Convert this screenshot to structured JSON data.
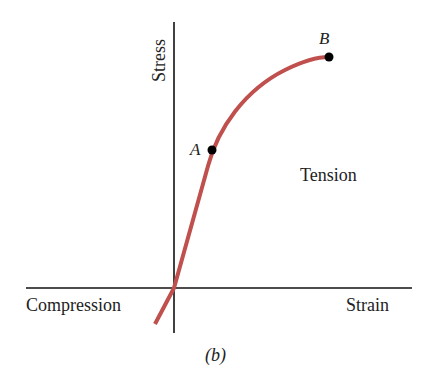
{
  "figure": {
    "caption": "(b)",
    "y_axis_label": "Stress",
    "x_axis_label": "Strain",
    "region_compression": "Compression",
    "region_tension": "Tension",
    "points": [
      {
        "id": "A",
        "label": "A"
      },
      {
        "id": "B",
        "label": "B"
      }
    ],
    "curve_color": "#c0504d",
    "axis_color": "#111111"
  }
}
